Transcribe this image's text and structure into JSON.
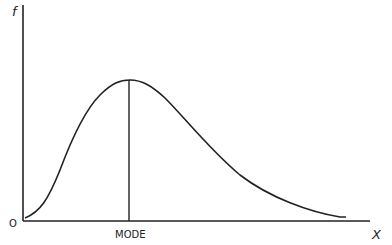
{
  "diagram": {
    "type": "skewed-distribution-curve",
    "y_axis_label": "f",
    "x_axis_label": "X",
    "origin_label": "O",
    "mode_label": "MODE",
    "colors": {
      "line": "#222222",
      "background": "#ffffff"
    }
  }
}
